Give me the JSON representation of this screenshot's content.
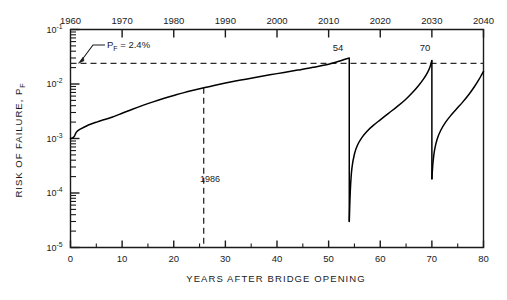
{
  "chart_data": {
    "type": "line",
    "title": "",
    "xlabel": "YEARS AFTER BRIDGE OPENING",
    "ylabel": "RISK OF FAILURE, P",
    "ylabel_sub": "F",
    "xlim": [
      0,
      80
    ],
    "ylim": [
      1e-05,
      0.1
    ],
    "yscale": "log",
    "grid": false,
    "legend": null,
    "xticks": [
      0,
      10,
      20,
      30,
      40,
      50,
      60,
      70,
      80
    ],
    "xticklabels": [
      "0",
      "10",
      "20",
      "30",
      "40",
      "50",
      "60",
      "70",
      "80"
    ],
    "xminorticks": [
      5,
      15,
      25,
      35,
      45,
      55,
      65,
      75
    ],
    "yticks": [
      0.1,
      0.01,
      0.001,
      0.0001,
      1e-05
    ],
    "yticklabels": [
      "10",
      "10",
      "10",
      "10",
      "10"
    ],
    "ytickexponents": [
      "-1",
      "-2",
      "-3",
      "-4",
      "-5"
    ],
    "secondary_axis": {
      "position": "top",
      "label": "",
      "ticks": [
        0,
        10,
        20,
        30,
        40,
        50,
        60,
        70,
        80
      ],
      "ticklabels": [
        "1960",
        "1970",
        "1980",
        "1990",
        "2000",
        "2010",
        "2020",
        "2030",
        "2040"
      ]
    },
    "annotations": [
      {
        "name": "threshold-label",
        "text": "P",
        "sub": "F",
        "text2": " = 2.4%",
        "x": 6.5,
        "y": 0.048
      },
      {
        "name": "repair-1-label",
        "text": "54",
        "x": 54,
        "y": 0.055
      },
      {
        "name": "repair-2-label",
        "text": "70",
        "x": 70,
        "y": 0.055
      },
      {
        "name": "year-1986-label",
        "text": "1986",
        "x": 27.5,
        "y": 0.00013
      }
    ],
    "reference_lines": [
      {
        "name": "threshold-2.4-percent",
        "orientation": "horizontal",
        "value": 0.024,
        "style": "dashed",
        "label": "P_F = 2.4%"
      },
      {
        "name": "year-1986",
        "orientation": "vertical",
        "value": 25.8,
        "style": "dashed",
        "label": "1986",
        "y_from": 0.0085,
        "y_to": 1e-05
      }
    ],
    "repair_events": [
      {
        "year": 54,
        "p_before": 0.03,
        "p_after": 3e-05
      },
      {
        "year": 70,
        "p_before": 0.027,
        "p_after": 0.00018
      }
    ],
    "series": [
      {
        "name": "risk-of-failure",
        "color": "#000000",
        "points": [
          [
            0.0,
            0.001
          ],
          [
            0.25,
            0.00101
          ],
          [
            0.5,
            0.00104
          ],
          [
            0.8,
            0.00112
          ],
          [
            1.0,
            0.00124
          ],
          [
            1.3,
            0.00136
          ],
          [
            1.7,
            0.00145
          ],
          [
            2.2,
            0.00154
          ],
          [
            3.0,
            0.00168
          ],
          [
            4.0,
            0.00184
          ],
          [
            5.0,
            0.00199
          ],
          [
            6.0,
            0.00214
          ],
          [
            8.0,
            0.00245
          ],
          [
            10.0,
            0.0029
          ],
          [
            12.0,
            0.00345
          ],
          [
            14.0,
            0.00405
          ],
          [
            16.0,
            0.0047
          ],
          [
            18.0,
            0.0054
          ],
          [
            20.0,
            0.00615
          ],
          [
            22.0,
            0.00695
          ],
          [
            25.8,
            0.0085
          ],
          [
            28.0,
            0.0095
          ],
          [
            30.0,
            0.0104
          ],
          [
            33.0,
            0.0118
          ],
          [
            36.0,
            0.0133
          ],
          [
            40.0,
            0.0155
          ],
          [
            44.0,
            0.018
          ],
          [
            47.0,
            0.0202
          ],
          [
            50.0,
            0.023
          ],
          [
            52.0,
            0.0262
          ],
          [
            53.2,
            0.0285
          ],
          [
            54.0,
            0.03
          ]
        ]
      },
      {
        "name": "risk-after-repair-1",
        "color": "#000000",
        "points": [
          [
            54.0,
            3e-05
          ],
          [
            54.2,
            0.00011
          ],
          [
            54.5,
            0.00028
          ],
          [
            55.0,
            0.00052
          ],
          [
            55.6,
            0.00076
          ],
          [
            56.4,
            0.00103
          ],
          [
            57.4,
            0.00135
          ],
          [
            58.6,
            0.00172
          ],
          [
            60.0,
            0.0022
          ],
          [
            61.6,
            0.0029
          ],
          [
            63.2,
            0.0038
          ],
          [
            64.8,
            0.0051
          ],
          [
            66.2,
            0.0069
          ],
          [
            67.4,
            0.0093
          ],
          [
            68.4,
            0.0124
          ],
          [
            69.2,
            0.0165
          ],
          [
            69.7,
            0.0215
          ],
          [
            70.0,
            0.027
          ]
        ]
      },
      {
        "name": "risk-after-repair-2",
        "color": "#000000",
        "points": [
          [
            70.0,
            0.00018
          ],
          [
            70.2,
            0.00035
          ],
          [
            70.5,
            0.0006
          ],
          [
            71.0,
            0.00096
          ],
          [
            71.7,
            0.0014
          ],
          [
            72.6,
            0.00195
          ],
          [
            73.6,
            0.0026
          ],
          [
            74.8,
            0.0035
          ],
          [
            76.0,
            0.0047
          ],
          [
            77.2,
            0.0065
          ],
          [
            78.2,
            0.0088
          ],
          [
            79.1,
            0.012
          ],
          [
            79.7,
            0.0152
          ],
          [
            80.0,
            0.017
          ]
        ]
      }
    ]
  },
  "axis_titles": {
    "x": "YEARS AFTER BRIDGE OPENING",
    "y_main": "RISK OF FAILURE, P",
    "y_sub": "F"
  },
  "tick_text": {
    "bottom": [
      "0",
      "10",
      "20",
      "30",
      "40",
      "50",
      "60",
      "70",
      "80"
    ],
    "top": [
      "1960",
      "1970",
      "1980",
      "1990",
      "2000",
      "2010",
      "2020",
      "2030",
      "2040"
    ],
    "left_mantissa": "10",
    "left_exponents": [
      "-1",
      "-2",
      "-3",
      "-4",
      "-5"
    ]
  },
  "annotation_text": {
    "threshold_p": "P",
    "threshold_sub": "F",
    "threshold_value": " = 2.4%",
    "repair1": "54",
    "repair2": "70",
    "year1986": "1986"
  },
  "colors": {
    "line": "#000000",
    "axis": "#1a1a1a",
    "dashed": "#2b2b2b",
    "background": "#ffffff"
  }
}
